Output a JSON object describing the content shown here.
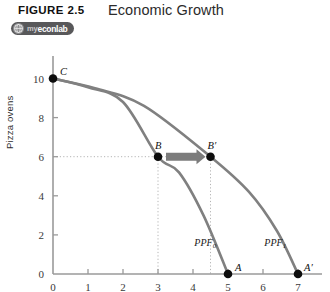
{
  "header": {
    "figure_number": "FIGURE 2.5",
    "title": "Economic Growth",
    "badge": {
      "icon": "myeconlab-globe-icon",
      "prefix": "my",
      "name": "econlab"
    }
  },
  "chart_data": {
    "type": "line",
    "title": "Economic Growth",
    "xlabel": "",
    "ylabel": "Pizza ovens",
    "xlim": [
      0,
      7.6
    ],
    "ylim": [
      0,
      11
    ],
    "grid": false,
    "legend": "none",
    "x_ticks": [
      "0",
      "1",
      "2",
      "3",
      "4",
      "5",
      "6",
      "7"
    ],
    "x_tick_values": [
      0,
      1,
      2,
      3,
      4,
      5,
      6,
      7
    ],
    "y_ticks": [
      "0",
      "2",
      "4",
      "6",
      "8",
      "10"
    ],
    "y_tick_values": [
      0,
      2,
      4,
      6,
      8,
      10
    ],
    "series": [
      {
        "name": "PPF0",
        "label": "PPF",
        "subscript": "0",
        "color": "#808080",
        "points": [
          {
            "x": 0,
            "y": 10
          },
          {
            "x": 1,
            "y": 9.55
          },
          {
            "x": 2,
            "y": 8.8
          },
          {
            "x": 3,
            "y": 6.0
          },
          {
            "x": 3.6,
            "y": 5.2
          },
          {
            "x": 4.3,
            "y": 3.0
          },
          {
            "x": 5,
            "y": 0
          }
        ]
      },
      {
        "name": "PPF1",
        "label": "PPF",
        "subscript": "1",
        "color": "#808080",
        "points": [
          {
            "x": 0,
            "y": 10
          },
          {
            "x": 1.2,
            "y": 9.5
          },
          {
            "x": 2.6,
            "y": 8.6
          },
          {
            "x": 4.5,
            "y": 6.0
          },
          {
            "x": 5.6,
            "y": 4.2
          },
          {
            "x": 6.4,
            "y": 2.2
          },
          {
            "x": 7,
            "y": 0
          }
        ]
      }
    ],
    "annotations": [
      {
        "name": "point-c",
        "label": "C",
        "x": 0,
        "y": 10
      },
      {
        "name": "point-b",
        "label": "B",
        "x": 3,
        "y": 6
      },
      {
        "name": "point-b-prime",
        "label": "B′",
        "x": 4.5,
        "y": 6
      },
      {
        "name": "point-a",
        "label": "A",
        "x": 5,
        "y": 0
      },
      {
        "name": "point-a-prime",
        "label": "A′",
        "x": 7,
        "y": 0
      }
    ],
    "arrow": {
      "name": "growth-arrow",
      "from": {
        "x": 3,
        "y": 6
      },
      "to": {
        "x": 4.5,
        "y": 6
      },
      "color": "#7c7c7c"
    },
    "guides": [
      {
        "name": "horizontal-guide-6",
        "orientation": "horizontal",
        "value": 6
      },
      {
        "name": "vertical-guide-3",
        "orientation": "vertical",
        "value": 3
      },
      {
        "name": "vertical-guide-4-5",
        "orientation": "vertical",
        "value": 4.5
      }
    ]
  }
}
